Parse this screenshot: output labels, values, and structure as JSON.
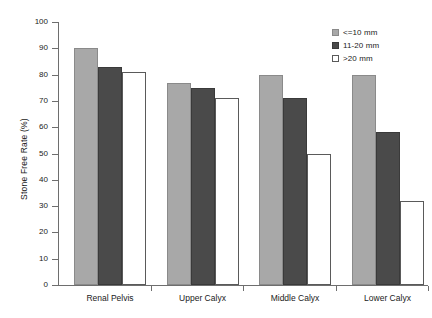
{
  "chart_data": {
    "type": "bar",
    "title": "",
    "xlabel": "",
    "ylabel": "Stone Free Rate (%)",
    "ylim": [
      0,
      100
    ],
    "ytick_step": 10,
    "yticks": [
      100,
      90,
      80,
      70,
      60,
      50,
      40,
      30,
      20,
      10,
      0
    ],
    "grid": false,
    "legend_position": "top-right",
    "categories": [
      "Renal Pelvis",
      "Upper Calyx",
      "Middle Calyx",
      "Lower Calyx"
    ],
    "series": [
      {
        "name": "<=10  mm",
        "color": "#a8a8a8",
        "values": [
          90,
          77,
          80,
          80
        ]
      },
      {
        "name": "11-20  mm",
        "color": "#4a4a4a",
        "values": [
          83,
          75,
          71,
          58
        ]
      },
      {
        "name": ">20  mm",
        "color": "#ffffff",
        "values": [
          81,
          71,
          50,
          32
        ]
      }
    ]
  },
  "colors": {
    "series_light": "#a8a8a8",
    "series_dark": "#4a4a4a",
    "series_white": "#ffffff",
    "axis": "#6e6e6e",
    "text": "#1a1a1a",
    "background": "#ffffff"
  }
}
